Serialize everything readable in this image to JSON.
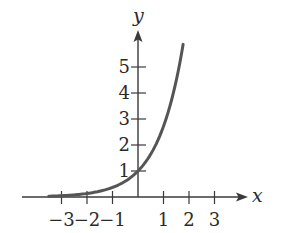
{
  "chart_data": {
    "type": "line",
    "title": "",
    "function": "y = e^x",
    "xlabel": "x",
    "ylabel": "y",
    "x_ticks": [
      -3,
      -2,
      -1,
      1,
      2,
      3
    ],
    "x_tick_labels": [
      "−3",
      "−2",
      "−1",
      "1",
      "2",
      "3"
    ],
    "y_ticks": [
      1,
      2,
      3,
      4,
      5
    ],
    "y_tick_labels": [
      "1",
      "2",
      "3",
      "4",
      "5"
    ],
    "xlim": [
      -4.5,
      4.3
    ],
    "ylim": [
      0,
      6.4
    ],
    "grid": false,
    "legend": null,
    "series": [
      {
        "name": "exponential curve",
        "x": [
          -3.5,
          -3,
          -2.5,
          -2,
          -1.5,
          -1,
          -0.5,
          0,
          0.25,
          0.5,
          0.75,
          1,
          1.25,
          1.5,
          1.77
        ],
        "y": [
          0.03,
          0.05,
          0.08,
          0.14,
          0.22,
          0.37,
          0.61,
          1.0,
          1.28,
          1.65,
          2.12,
          2.72,
          3.49,
          4.48,
          5.87
        ],
        "color": "#555555"
      }
    ]
  },
  "colors": {
    "axis": "#3a3a3a",
    "curve": "#555555",
    "text": "#2a2a2a"
  }
}
